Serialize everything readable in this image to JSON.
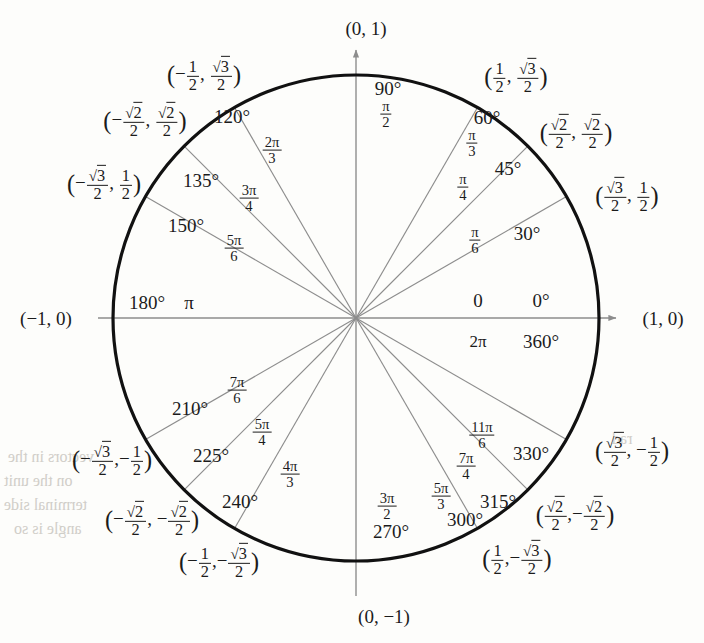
{
  "figure": {
    "type": "unit-circle",
    "center_px": [
      356,
      318
    ],
    "radius_px": 243,
    "circle_color": "#111111",
    "spoke_color": "#8d8d8d",
    "axis_color": "#8d8d8d",
    "background": "#fdfdfb"
  },
  "axis_labels": {
    "right": "(1, 0)",
    "top": "(0, 1)",
    "left": "(−1, 0)",
    "bottom": "(0, −1)"
  },
  "angles": [
    {
      "deg": "0°",
      "rad_num": "0",
      "rad_den": "",
      "rad_plain": "0",
      "coord_x": "1",
      "coord_y": "0",
      "degrees": 0
    },
    {
      "deg": "360°",
      "rad_num": "2π",
      "rad_den": "",
      "rad_plain": "2π",
      "coord_x": "1",
      "coord_y": "0",
      "degrees": 360
    },
    {
      "deg": "30°",
      "rad_num": "π",
      "rad_den": "6",
      "rad_plain": "π/6",
      "degrees": 30
    },
    {
      "deg": "45°",
      "rad_num": "π",
      "rad_den": "4",
      "rad_plain": "π/4",
      "degrees": 45
    },
    {
      "deg": "60°",
      "rad_num": "π",
      "rad_den": "3",
      "rad_plain": "π/3",
      "degrees": 60
    },
    {
      "deg": "90°",
      "rad_num": "π",
      "rad_den": "2",
      "rad_plain": "π/2",
      "degrees": 90
    },
    {
      "deg": "120°",
      "rad_num": "2π",
      "rad_den": "3",
      "rad_plain": "2π/3",
      "degrees": 120
    },
    {
      "deg": "135°",
      "rad_num": "3π",
      "rad_den": "4",
      "rad_plain": "3π/4",
      "degrees": 135
    },
    {
      "deg": "150°",
      "rad_num": "5π",
      "rad_den": "6",
      "rad_plain": "5π/6",
      "degrees": 150
    },
    {
      "deg": "180°",
      "rad_num": "π",
      "rad_den": "",
      "rad_plain": "π",
      "degrees": 180
    },
    {
      "deg": "210°",
      "rad_num": "7π",
      "rad_den": "6",
      "rad_plain": "7π/6",
      "degrees": 210
    },
    {
      "deg": "225°",
      "rad_num": "5π",
      "rad_den": "4",
      "rad_plain": "5π/4",
      "degrees": 225
    },
    {
      "deg": "240°",
      "rad_num": "4π",
      "rad_den": "3",
      "rad_plain": "4π/3",
      "degrees": 240
    },
    {
      "deg": "270°",
      "rad_num": "3π",
      "rad_den": "2",
      "rad_plain": "3π/2",
      "degrees": 270
    },
    {
      "deg": "300°",
      "rad_num": "5π",
      "rad_den": "3",
      "rad_plain": "5π/3",
      "degrees": 300
    },
    {
      "deg": "315°",
      "rad_num": "7π",
      "rad_den": "4",
      "rad_plain": "7π/4",
      "degrees": 315
    },
    {
      "deg": "330°",
      "rad_num": "11π",
      "rad_den": "6",
      "rad_plain": "11π/6",
      "degrees": 330
    }
  ],
  "degree_labels": {
    "d0": "0°",
    "d30": "30°",
    "d45": "45°",
    "d60": "60°",
    "d90": "90°",
    "d120": "120°",
    "d135": "135°",
    "d150": "150°",
    "d180": "180°",
    "d210": "210°",
    "d225": "225°",
    "d240": "240°",
    "d270": "270°",
    "d300": "300°",
    "d315": "315°",
    "d330": "330°",
    "d360": "360°",
    "zero": "0"
  },
  "coordinates": {
    "c30": {
      "x_num": "√3",
      "x_den": "2",
      "y_num": "1",
      "y_den": "2",
      "text": "(√3/2, 1/2)",
      "x_neg": false,
      "y_neg": false
    },
    "c45": {
      "x_num": "√2",
      "x_den": "2",
      "y_num": "√2",
      "y_den": "2",
      "text": "(√2/2, √2/2)",
      "x_neg": false,
      "y_neg": false
    },
    "c60": {
      "x_num": "1",
      "x_den": "2",
      "y_num": "√3",
      "y_den": "2",
      "text": "(1/2, √3/2)",
      "x_neg": false,
      "y_neg": false
    },
    "c120": {
      "x_num": "1",
      "x_den": "2",
      "y_num": "√3",
      "y_den": "2",
      "text": "(−1/2, √3/2)",
      "x_neg": true,
      "y_neg": false
    },
    "c135": {
      "x_num": "√2",
      "x_den": "2",
      "y_num": "√2",
      "y_den": "2",
      "text": "(−√2/2, √2/2)",
      "x_neg": true,
      "y_neg": false
    },
    "c150": {
      "x_num": "√3",
      "x_den": "2",
      "y_num": "1",
      "y_den": "2",
      "text": "(−√3/2, 1/2)",
      "x_neg": true,
      "y_neg": false
    },
    "c210": {
      "x_num": "√3",
      "x_den": "2",
      "y_num": "1",
      "y_den": "2",
      "text": "(−√3/2, −1/2)",
      "x_neg": true,
      "y_neg": true
    },
    "c225": {
      "x_num": "√2",
      "x_den": "2",
      "y_num": "√2",
      "y_den": "2",
      "text": "(−√2/2, −√2/2)",
      "x_neg": true,
      "y_neg": true
    },
    "c240": {
      "x_num": "1",
      "x_den": "2",
      "y_num": "√3",
      "y_den": "2",
      "text": "(−1/2, −√3/2)",
      "x_neg": true,
      "y_neg": true
    },
    "c300": {
      "x_num": "1",
      "x_den": "2",
      "y_num": "√3",
      "y_den": "2",
      "text": "(1/2, −√3/2)",
      "x_neg": false,
      "y_neg": true
    },
    "c315": {
      "x_num": "√2",
      "x_den": "2",
      "y_num": "√2",
      "y_den": "2",
      "text": "(√2/2, −√2/2)",
      "x_neg": false,
      "y_neg": true
    },
    "c330": {
      "x_num": "√3",
      "x_den": "2",
      "y_num": "1",
      "y_den": "2",
      "text": "(√3/2, −1/2)",
      "x_neg": false,
      "y_neg": true
    }
  },
  "chart_data": {
    "type": "scatter",
    "title": "",
    "xlabel": "",
    "ylabel": "",
    "xlim": [
      -1,
      1
    ],
    "ylim": [
      -1,
      1
    ],
    "grid": false,
    "legend": "none",
    "categories": [
      "0°/360°",
      "30°",
      "45°",
      "60°",
      "90°",
      "120°",
      "135°",
      "150°",
      "180°",
      "210°",
      "225°",
      "240°",
      "270°",
      "300°",
      "315°",
      "330°"
    ],
    "series": [
      {
        "name": "cos",
        "values": [
          1,
          0.866,
          0.707,
          0.5,
          0,
          -0.5,
          -0.707,
          -0.866,
          -1,
          -0.866,
          -0.707,
          -0.5,
          0,
          0.5,
          0.707,
          0.866
        ]
      },
      {
        "name": "sin",
        "values": [
          0,
          0.5,
          0.707,
          0.866,
          1,
          0.866,
          0.707,
          0.5,
          0,
          -0.5,
          -0.707,
          -0.866,
          -1,
          -0.866,
          -0.707,
          -0.5
        ]
      }
    ]
  }
}
